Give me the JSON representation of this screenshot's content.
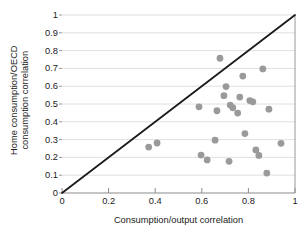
{
  "chart_data": {
    "type": "scatter",
    "title": "",
    "xlabel": "Consumption/output correlation",
    "ylabel_lines": [
      "Home consumption/OECD",
      "consumption correlation"
    ],
    "ylabel": "Home consumption/OECD consumption correlation",
    "xlim": [
      0,
      1
    ],
    "ylim": [
      0,
      1
    ],
    "xticks": [
      "0",
      "0.2",
      "0.4",
      "0.6",
      "0.8",
      "1"
    ],
    "xtick_values": [
      0,
      0.2,
      0.4,
      0.6,
      0.8,
      1
    ],
    "yticks": [
      "0",
      "0.1",
      "0.2",
      "0.3",
      "0.4",
      "0.5",
      "0.6",
      "0.7",
      "0.8",
      "0.9",
      "1"
    ],
    "ytick_values": [
      0,
      0.1,
      0.2,
      0.3,
      0.4,
      0.5,
      0.6,
      0.7,
      0.8,
      0.9,
      1
    ],
    "grid": "horizontal",
    "legend": null,
    "reference_line": {
      "name": "45-degree-line",
      "from": [
        0,
        0
      ],
      "to": [
        1,
        1
      ],
      "color": "#1a1a1a",
      "width": 1.8
    },
    "marker": {
      "color": "#9a9a9a",
      "size": 3.4,
      "shape": "circle"
    },
    "points": [
      {
        "x": 0.372,
        "y": 0.258
      },
      {
        "x": 0.408,
        "y": 0.281
      },
      {
        "x": 0.588,
        "y": 0.484
      },
      {
        "x": 0.597,
        "y": 0.213
      },
      {
        "x": 0.623,
        "y": 0.186
      },
      {
        "x": 0.657,
        "y": 0.297
      },
      {
        "x": 0.665,
        "y": 0.462
      },
      {
        "x": 0.678,
        "y": 0.757
      },
      {
        "x": 0.695,
        "y": 0.547
      },
      {
        "x": 0.704,
        "y": 0.598
      },
      {
        "x": 0.717,
        "y": 0.178
      },
      {
        "x": 0.722,
        "y": 0.494
      },
      {
        "x": 0.733,
        "y": 0.479
      },
      {
        "x": 0.754,
        "y": 0.449
      },
      {
        "x": 0.763,
        "y": 0.539
      },
      {
        "x": 0.776,
        "y": 0.657
      },
      {
        "x": 0.785,
        "y": 0.334
      },
      {
        "x": 0.806,
        "y": 0.519
      },
      {
        "x": 0.819,
        "y": 0.512
      },
      {
        "x": 0.832,
        "y": 0.242
      },
      {
        "x": 0.845,
        "y": 0.211
      },
      {
        "x": 0.862,
        "y": 0.697
      },
      {
        "x": 0.879,
        "y": 0.112
      },
      {
        "x": 0.888,
        "y": 0.471
      },
      {
        "x": 0.94,
        "y": 0.279
      }
    ]
  },
  "style": {
    "background": "#ffffff",
    "grid_color": "#d8d8d8",
    "axis_color": "#8c8c8c",
    "text_color": "#1b1b1b"
  }
}
